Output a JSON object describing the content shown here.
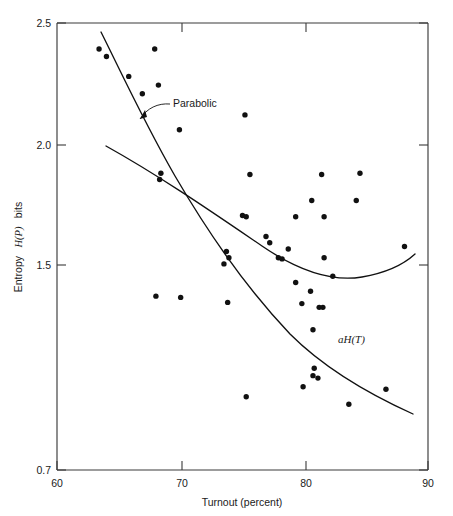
{
  "chart_data": {
    "type": "scatter",
    "title": "",
    "xlabel": "Turnout (percent)",
    "ylabel": "Entropy H(P) bits",
    "ylabel_plain": "Entropy",
    "ylabel_italic": "H(P)",
    "ylabel_suffix": "bits",
    "xlim": [
      60,
      90
    ],
    "ylim": [
      0.7,
      2.5
    ],
    "xticks": [
      60,
      70,
      80,
      90
    ],
    "xtick_labels": [
      "60",
      "70",
      "80",
      "90"
    ],
    "yticks": [
      0.7,
      1.5,
      2.0,
      2.5
    ],
    "ytick_labels": [
      "0.7",
      "1.5",
      "2.0",
      "2.5"
    ],
    "grid": false,
    "legend": "none",
    "marker": "filled-circle",
    "marker_color": "#111111",
    "points": [
      [
        63.4,
        2.395
      ],
      [
        64.0,
        2.365
      ],
      [
        65.8,
        2.285
      ],
      [
        66.9,
        2.215
      ],
      [
        67.9,
        2.395
      ],
      [
        68.2,
        2.25
      ],
      [
        68.4,
        1.895
      ],
      [
        68.3,
        1.87
      ],
      [
        68.0,
        1.4
      ],
      [
        69.9,
        2.07
      ],
      [
        70.0,
        1.395
      ],
      [
        73.5,
        1.53
      ],
      [
        73.7,
        1.58
      ],
      [
        73.9,
        1.555
      ],
      [
        73.8,
        1.375
      ],
      [
        75.0,
        1.725
      ],
      [
        75.3,
        1.72
      ],
      [
        75.2,
        2.13
      ],
      [
        75.3,
        0.995
      ],
      [
        75.6,
        1.89
      ],
      [
        76.9,
        1.64
      ],
      [
        77.2,
        1.615
      ],
      [
        77.9,
        1.555
      ],
      [
        78.2,
        1.55
      ],
      [
        78.7,
        1.59
      ],
      [
        79.3,
        1.455
      ],
      [
        79.3,
        1.72
      ],
      [
        79.8,
        1.37
      ],
      [
        79.9,
        1.035
      ],
      [
        80.5,
        1.42
      ],
      [
        80.6,
        1.785
      ],
      [
        80.7,
        1.265
      ],
      [
        80.8,
        1.11
      ],
      [
        80.7,
        1.08
      ],
      [
        81.1,
        1.07
      ],
      [
        81.2,
        1.355
      ],
      [
        81.5,
        1.355
      ],
      [
        81.6,
        1.555
      ],
      [
        81.4,
        1.89
      ],
      [
        81.6,
        1.72
      ],
      [
        82.3,
        1.48
      ],
      [
        83.6,
        0.965
      ],
      [
        84.2,
        1.785
      ],
      [
        84.5,
        1.895
      ],
      [
        86.6,
        1.025
      ],
      [
        88.1,
        1.6
      ]
    ],
    "curves": [
      {
        "name": "Parabolic",
        "label": "Parabolic",
        "description": "shallow parabola opening upward with minimum near 82 percent"
      },
      {
        "name": "aH(T)",
        "label": "aH(T)",
        "description": "steeply decreasing curve from 2.40 at 64 percent to 1.10 at 88 percent"
      }
    ],
    "annotations": [
      {
        "text": "Parabolic",
        "x": 71.5,
        "y": 2.09,
        "arrow_to": [
          69.5,
          1.96
        ]
      },
      {
        "text": "aH(T)",
        "x": 82.5,
        "y": 1.23,
        "arrow_to": null
      }
    ]
  }
}
